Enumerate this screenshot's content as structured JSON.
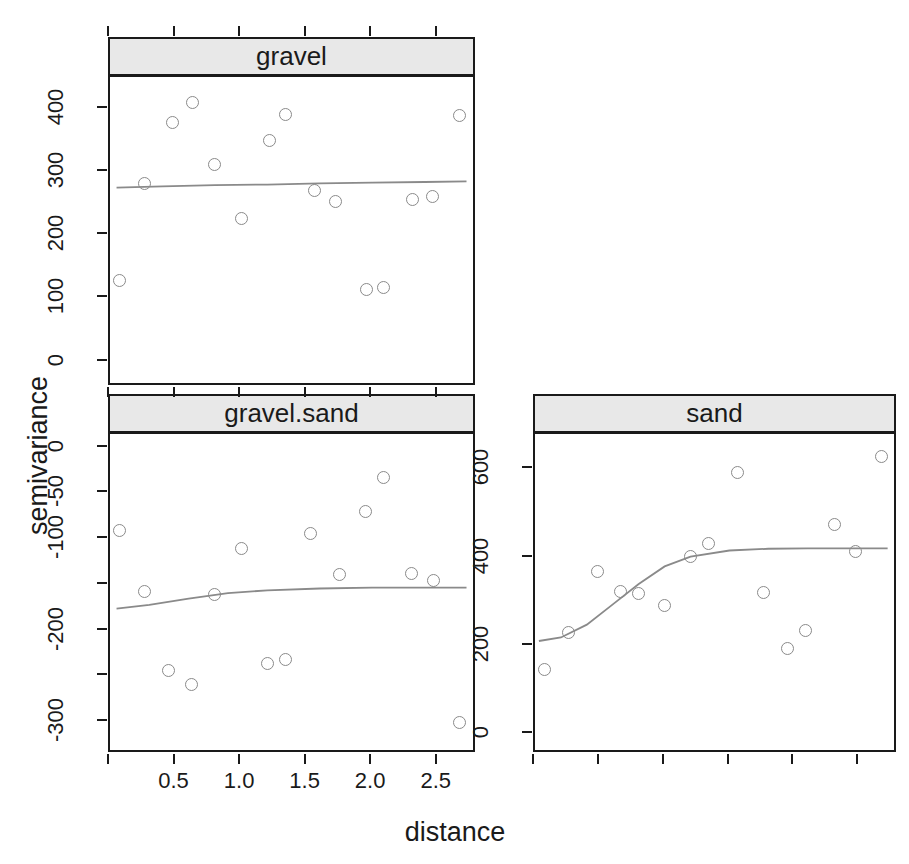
{
  "figure": {
    "ylabel": "semivariance",
    "xlabel": "distance",
    "bg": "#ffffff",
    "strip_bg": "#e8e8e8",
    "frame_color": "#1a1a1a",
    "point_color": "#8a8a8a",
    "line_color": "#8a8a8a"
  },
  "chart_data": {
    "type": "scatter",
    "title": "",
    "xlabel": "distance",
    "ylabel": "semivariance",
    "grid": false,
    "legend": "none",
    "layout": "3 panels (lattice conditioning): gravel top-left, gravel.sand bottom-left, sand bottom-right",
    "panels": [
      {
        "name": "gravel",
        "strip_label": "gravel",
        "xlim": [
          0.0,
          2.8
        ],
        "ylim": [
          -40,
          450
        ],
        "xticks": [
          0.0,
          0.5,
          1.0,
          1.5,
          2.0,
          2.5
        ],
        "xticklabels": [
          "",
          "",
          "",
          "",
          "",
          ""
        ],
        "yticks": [
          0,
          100,
          200,
          300,
          400
        ],
        "yticklabels": [
          "0",
          "100",
          "200",
          "300",
          "400"
        ],
        "points": [
          {
            "x": 0.07,
            "y": 128
          },
          {
            "x": 0.26,
            "y": 281
          },
          {
            "x": 0.48,
            "y": 378
          },
          {
            "x": 0.63,
            "y": 409
          },
          {
            "x": 0.8,
            "y": 311
          },
          {
            "x": 1.0,
            "y": 227
          },
          {
            "x": 1.22,
            "y": 350
          },
          {
            "x": 1.34,
            "y": 391
          },
          {
            "x": 1.56,
            "y": 271
          },
          {
            "x": 1.72,
            "y": 253
          },
          {
            "x": 1.96,
            "y": 114
          },
          {
            "x": 2.09,
            "y": 118
          },
          {
            "x": 2.31,
            "y": 256
          },
          {
            "x": 2.46,
            "y": 261
          },
          {
            "x": 2.67,
            "y": 389
          }
        ],
        "fit": {
          "kind": "flat-nugget-model",
          "x": [
            0.05,
            0.4,
            0.8,
            1.2,
            1.6,
            2.0,
            2.4,
            2.72
          ],
          "y": [
            275,
            277,
            279,
            280,
            282,
            283,
            284,
            285
          ]
        }
      },
      {
        "name": "gravel.sand",
        "strip_label": "gravel.sand",
        "xlim": [
          0.0,
          2.8
        ],
        "ylim": [
          -335,
          15
        ],
        "xticks": [
          0.0,
          0.5,
          1.0,
          1.5,
          2.0,
          2.5
        ],
        "xticklabels": [
          "",
          "0.5",
          "1.0",
          "1.5",
          "2.0",
          "2.5"
        ],
        "yticks": [
          0,
          -50,
          -100,
          -150,
          -200,
          -250,
          -300
        ],
        "yticklabels": [
          "0",
          "-50",
          "-100",
          "",
          "-200",
          "",
          "-300"
        ],
        "points": [
          {
            "x": 0.07,
            "y": -91
          },
          {
            "x": 0.26,
            "y": -157
          },
          {
            "x": 0.45,
            "y": -244
          },
          {
            "x": 0.62,
            "y": -259
          },
          {
            "x": 0.8,
            "y": -161
          },
          {
            "x": 1.0,
            "y": -110
          },
          {
            "x": 1.2,
            "y": -236
          },
          {
            "x": 1.34,
            "y": -232
          },
          {
            "x": 1.53,
            "y": -94
          },
          {
            "x": 1.75,
            "y": -139
          },
          {
            "x": 1.95,
            "y": -70
          },
          {
            "x": 2.09,
            "y": -33
          },
          {
            "x": 2.3,
            "y": -138
          },
          {
            "x": 2.47,
            "y": -145
          },
          {
            "x": 2.67,
            "y": -300
          }
        ],
        "fit": {
          "kind": "rising-exponential-model",
          "x": [
            0.05,
            0.3,
            0.6,
            0.9,
            1.2,
            1.6,
            2.0,
            2.4,
            2.72
          ],
          "y": [
            -176,
            -172,
            -165,
            -159,
            -156,
            -154,
            -153,
            -153,
            -153
          ]
        }
      },
      {
        "name": "sand",
        "strip_label": "sand",
        "xlim": [
          0.0,
          2.8
        ],
        "ylim": [
          -45,
          680
        ],
        "xticks": [
          0.0,
          0.5,
          1.0,
          1.5,
          2.0,
          2.5
        ],
        "xticklabels": [
          "",
          "",
          "",
          "",
          "",
          ""
        ],
        "yticks": [
          0,
          200,
          400,
          600
        ],
        "yticklabels": [
          "0",
          "200",
          "400",
          "600"
        ],
        "points": [
          {
            "x": 0.07,
            "y": 146
          },
          {
            "x": 0.26,
            "y": 231
          },
          {
            "x": 0.48,
            "y": 368
          },
          {
            "x": 0.66,
            "y": 323
          },
          {
            "x": 0.8,
            "y": 318
          },
          {
            "x": 1.0,
            "y": 291
          },
          {
            "x": 1.2,
            "y": 403
          },
          {
            "x": 1.34,
            "y": 432
          },
          {
            "x": 1.56,
            "y": 592
          },
          {
            "x": 1.76,
            "y": 321
          },
          {
            "x": 1.95,
            "y": 194
          },
          {
            "x": 2.09,
            "y": 234
          },
          {
            "x": 2.31,
            "y": 474
          },
          {
            "x": 2.47,
            "y": 413
          },
          {
            "x": 2.67,
            "y": 628
          }
        ],
        "fit": {
          "kind": "spherical-exponential-model",
          "x": [
            0.03,
            0.2,
            0.4,
            0.6,
            0.8,
            1.0,
            1.2,
            1.5,
            1.8,
            2.1,
            2.4,
            2.72
          ],
          "y": [
            211,
            219,
            248,
            294,
            340,
            380,
            402,
            416,
            420,
            421,
            421,
            421
          ]
        }
      }
    ]
  }
}
